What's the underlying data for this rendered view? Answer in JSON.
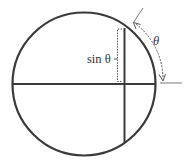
{
  "diagram": {
    "type": "unit-circle-sine",
    "labels": {
      "sine": "sin θ",
      "angle": "θ"
    },
    "colors": {
      "stroke": "#3a3a3a",
      "thin": "#555555",
      "background": "#ffffff"
    }
  }
}
